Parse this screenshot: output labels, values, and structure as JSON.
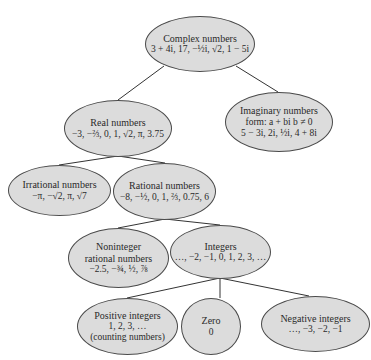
{
  "diagram": {
    "type": "tree",
    "colors": {
      "node_fill": "#dcdcdc",
      "node_stroke": "#4a4a4a",
      "edge": "#333333",
      "background": "#ffffff"
    },
    "nodes": {
      "complex": {
        "title": "Complex numbers",
        "lines": [
          "3 + 4i, 17, −½i, √2, 1 − 5i"
        ]
      },
      "real": {
        "title": "Real numbers",
        "lines": [
          "−3, −⅔, 0, 1, √2, π, 3.75"
        ]
      },
      "imaginary": {
        "title": "Imaginary numbers",
        "lines": [
          "form: a + bi    b ≠ 0",
          "5 − 3i, 2i, ½i, 4 + 8i"
        ]
      },
      "irrational": {
        "title": "Irrational numbers",
        "lines": [
          "−π, −√2, π, √7"
        ]
      },
      "rational": {
        "title": "Rational numbers",
        "lines": [
          "−8, −½, 0, 1, ⅔, 0.75, 6"
        ]
      },
      "noninteger": {
        "title": "Noninteger",
        "lines": [
          "rational numbers",
          "−2.5, −¾, ½, ⅞"
        ]
      },
      "integers": {
        "title": "Integers",
        "lines": [
          "…, −2, −1, 0, 1, 2, 3, …"
        ]
      },
      "positive": {
        "title": "Positive integers",
        "lines": [
          "1, 2, 3, …",
          "(counting numbers)"
        ]
      },
      "zero": {
        "title": "Zero",
        "lines": [
          "0"
        ]
      },
      "negative": {
        "title": "Negative integers",
        "lines": [
          "…, −3, −2, −1"
        ]
      }
    },
    "edges": [
      [
        "complex",
        "real"
      ],
      [
        "complex",
        "imaginary"
      ],
      [
        "real",
        "irrational"
      ],
      [
        "real",
        "rational"
      ],
      [
        "rational",
        "noninteger"
      ],
      [
        "rational",
        "integers"
      ],
      [
        "integers",
        "positive"
      ],
      [
        "integers",
        "zero"
      ],
      [
        "integers",
        "negative"
      ]
    ]
  }
}
